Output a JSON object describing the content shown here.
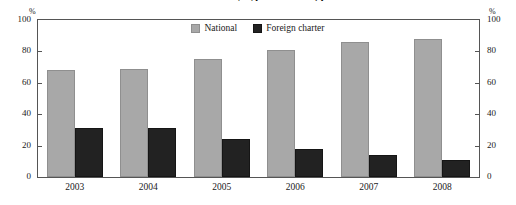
{
  "chart_data": {
    "type": "bar",
    "title": "Share of loans by type of lender, per cent",
    "categories": [
      "2003",
      "2004",
      "2005",
      "2006",
      "2007",
      "2008"
    ],
    "series": [
      {
        "name": "National",
        "color": "#a8a8a8",
        "values": [
          68,
          69,
          75,
          81,
          86,
          88
        ]
      },
      {
        "name": "Foreign charter",
        "color": "#222222",
        "values": [
          31,
          31,
          24,
          18,
          14,
          11
        ]
      }
    ],
    "xlabel": "",
    "ylabel": "%",
    "ylim": [
      0,
      100
    ],
    "yticks": [
      0,
      20,
      40,
      60,
      80,
      100
    ],
    "ytick_labels": [
      "0",
      "20",
      "40",
      "60",
      "80",
      "100"
    ],
    "unit_left": "%",
    "unit_right": "%",
    "grid": false,
    "legend_position": "top-center",
    "dual_axis": true
  }
}
